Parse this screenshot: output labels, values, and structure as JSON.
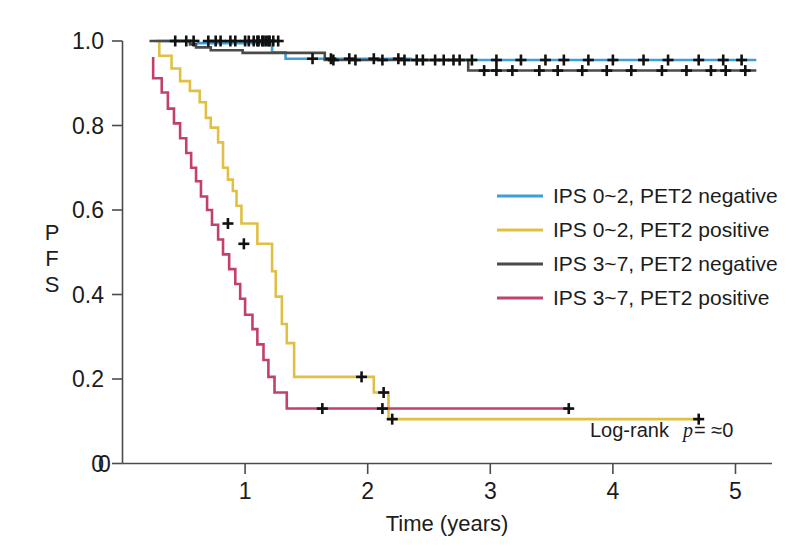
{
  "chart_data": {
    "type": "line",
    "subtype": "kaplan-meier-step",
    "title": "",
    "xlabel": "Time (years)",
    "ylabel": "PFS",
    "xlim": [
      0,
      5.2
    ],
    "ylim": [
      0,
      1.02
    ],
    "xticks": [
      "0",
      "1",
      "2",
      "3",
      "4",
      "5"
    ],
    "xtick_values": [
      0,
      1,
      2,
      3,
      4,
      5
    ],
    "yticks": [
      "0",
      "0.2",
      "0.4",
      "0.6",
      "0.8",
      "1.0"
    ],
    "ytick_values": [
      0,
      0.2,
      0.4,
      0.6,
      0.8,
      1.0
    ],
    "grid": false,
    "legend_position": "center-right",
    "annotation": {
      "prefix": "Log-rank ",
      "italic": "p",
      "suffix": "= ≈0",
      "full": "Log-rank p= ≈0"
    },
    "series": [
      {
        "name": "IPS 0~2, PET2 negative",
        "color": "#3a9fdc",
        "points": [
          [
            0.27,
            1.0
          ],
          [
            0.62,
            1.0
          ],
          [
            0.62,
            0.995
          ],
          [
            1.22,
            0.995
          ],
          [
            1.22,
            0.973
          ],
          [
            1.33,
            0.973
          ],
          [
            1.33,
            0.958
          ],
          [
            2.35,
            0.958
          ],
          [
            2.35,
            0.955
          ],
          [
            5.17,
            0.955
          ]
        ],
        "censors": [
          [
            0.52,
            1.0
          ],
          [
            0.7,
            1.0
          ],
          [
            0.8,
            1.0
          ],
          [
            0.92,
            1.0
          ],
          [
            1.03,
            1.0
          ],
          [
            1.1,
            1.0
          ],
          [
            1.14,
            1.0
          ],
          [
            1.17,
            1.0
          ],
          [
            1.2,
            1.0
          ],
          [
            1.55,
            0.958
          ],
          [
            1.7,
            0.958
          ],
          [
            1.85,
            0.958
          ],
          [
            2.05,
            0.958
          ],
          [
            2.25,
            0.958
          ],
          [
            2.4,
            0.955
          ],
          [
            2.55,
            0.955
          ],
          [
            2.7,
            0.955
          ],
          [
            2.85,
            0.955
          ],
          [
            3.05,
            0.955
          ],
          [
            3.25,
            0.955
          ],
          [
            3.45,
            0.955
          ],
          [
            3.6,
            0.955
          ],
          [
            3.8,
            0.955
          ],
          [
            4.0,
            0.955
          ],
          [
            4.25,
            0.955
          ],
          [
            4.45,
            0.955
          ],
          [
            4.7,
            0.955
          ],
          [
            4.9,
            0.955
          ],
          [
            5.05,
            0.955
          ]
        ]
      },
      {
        "name": "IPS 0~2, PET2 positive",
        "color": "#e0c044",
        "points": [
          [
            0.3,
            1.0
          ],
          [
            0.3,
            0.965
          ],
          [
            0.4,
            0.965
          ],
          [
            0.4,
            0.935
          ],
          [
            0.47,
            0.935
          ],
          [
            0.47,
            0.905
          ],
          [
            0.55,
            0.905
          ],
          [
            0.55,
            0.882
          ],
          [
            0.63,
            0.882
          ],
          [
            0.63,
            0.855
          ],
          [
            0.68,
            0.855
          ],
          [
            0.68,
            0.818
          ],
          [
            0.72,
            0.818
          ],
          [
            0.72,
            0.795
          ],
          [
            0.78,
            0.795
          ],
          [
            0.78,
            0.76
          ],
          [
            0.82,
            0.76
          ],
          [
            0.82,
            0.7
          ],
          [
            0.86,
            0.7
          ],
          [
            0.86,
            0.672
          ],
          [
            0.9,
            0.672
          ],
          [
            0.9,
            0.645
          ],
          [
            0.93,
            0.645
          ],
          [
            0.93,
            0.61
          ],
          [
            0.97,
            0.61
          ],
          [
            0.97,
            0.568
          ],
          [
            1.1,
            0.568
          ],
          [
            1.1,
            0.52
          ],
          [
            1.22,
            0.52
          ],
          [
            1.22,
            0.455
          ],
          [
            1.25,
            0.455
          ],
          [
            1.25,
            0.395
          ],
          [
            1.3,
            0.395
          ],
          [
            1.3,
            0.33
          ],
          [
            1.34,
            0.33
          ],
          [
            1.34,
            0.285
          ],
          [
            1.4,
            0.285
          ],
          [
            1.4,
            0.205
          ],
          [
            2.05,
            0.205
          ],
          [
            2.05,
            0.168
          ],
          [
            2.17,
            0.168
          ],
          [
            2.17,
            0.105
          ],
          [
            4.72,
            0.105
          ]
        ],
        "censors": [
          [
            0.86,
            0.568
          ],
          [
            0.99,
            0.52
          ],
          [
            1.95,
            0.205
          ],
          [
            2.13,
            0.168
          ],
          [
            2.2,
            0.105
          ],
          [
            4.7,
            0.105
          ]
        ]
      },
      {
        "name": "IPS 3~7, PET2 negative",
        "color": "#4a4a4a",
        "points": [
          [
            0.22,
            1.0
          ],
          [
            0.55,
            1.0
          ],
          [
            0.55,
            0.992
          ],
          [
            0.6,
            0.992
          ],
          [
            0.6,
            0.985
          ],
          [
            0.72,
            0.985
          ],
          [
            0.72,
            0.978
          ],
          [
            0.98,
            0.978
          ],
          [
            0.98,
            0.972
          ],
          [
            1.65,
            0.972
          ],
          [
            1.65,
            0.955
          ],
          [
            2.82,
            0.955
          ],
          [
            2.82,
            0.93
          ],
          [
            5.17,
            0.93
          ]
        ],
        "censors": [
          [
            0.43,
            1.0
          ],
          [
            0.58,
            1.0
          ],
          [
            0.76,
            1.0
          ],
          [
            0.88,
            1.0
          ],
          [
            1.0,
            1.0
          ],
          [
            1.07,
            1.0
          ],
          [
            1.11,
            1.0
          ],
          [
            1.15,
            1.0
          ],
          [
            1.19,
            1.0
          ],
          [
            1.23,
            1.0
          ],
          [
            1.27,
            1.0
          ],
          [
            1.72,
            0.955
          ],
          [
            1.9,
            0.955
          ],
          [
            2.12,
            0.955
          ],
          [
            2.3,
            0.955
          ],
          [
            2.45,
            0.955
          ],
          [
            2.62,
            0.955
          ],
          [
            2.75,
            0.955
          ],
          [
            2.95,
            0.93
          ],
          [
            3.05,
            0.93
          ],
          [
            3.18,
            0.93
          ],
          [
            3.4,
            0.93
          ],
          [
            3.55,
            0.93
          ],
          [
            3.75,
            0.93
          ],
          [
            3.95,
            0.93
          ],
          [
            4.15,
            0.93
          ],
          [
            4.4,
            0.93
          ],
          [
            4.6,
            0.93
          ],
          [
            4.8,
            0.93
          ],
          [
            4.92,
            0.93
          ],
          [
            5.08,
            0.93
          ]
        ]
      },
      {
        "name": "IPS 3~7, PET2 positive",
        "color": "#c2416a",
        "points": [
          [
            0.25,
            0.962
          ],
          [
            0.25,
            0.912
          ],
          [
            0.32,
            0.912
          ],
          [
            0.32,
            0.878
          ],
          [
            0.37,
            0.878
          ],
          [
            0.37,
            0.84
          ],
          [
            0.42,
            0.84
          ],
          [
            0.42,
            0.805
          ],
          [
            0.47,
            0.805
          ],
          [
            0.47,
            0.77
          ],
          [
            0.52,
            0.77
          ],
          [
            0.52,
            0.735
          ],
          [
            0.56,
            0.735
          ],
          [
            0.56,
            0.7
          ],
          [
            0.6,
            0.7
          ],
          [
            0.6,
            0.668
          ],
          [
            0.64,
            0.668
          ],
          [
            0.64,
            0.632
          ],
          [
            0.69,
            0.632
          ],
          [
            0.69,
            0.6
          ],
          [
            0.73,
            0.6
          ],
          [
            0.73,
            0.565
          ],
          [
            0.78,
            0.565
          ],
          [
            0.78,
            0.53
          ],
          [
            0.82,
            0.53
          ],
          [
            0.82,
            0.495
          ],
          [
            0.87,
            0.495
          ],
          [
            0.87,
            0.46
          ],
          [
            0.92,
            0.46
          ],
          [
            0.92,
            0.425
          ],
          [
            0.96,
            0.425
          ],
          [
            0.96,
            0.39
          ],
          [
            1.0,
            0.39
          ],
          [
            1.0,
            0.352
          ],
          [
            1.06,
            0.352
          ],
          [
            1.06,
            0.318
          ],
          [
            1.1,
            0.318
          ],
          [
            1.1,
            0.282
          ],
          [
            1.15,
            0.282
          ],
          [
            1.15,
            0.245
          ],
          [
            1.19,
            0.245
          ],
          [
            1.19,
            0.205
          ],
          [
            1.24,
            0.205
          ],
          [
            1.24,
            0.168
          ],
          [
            1.34,
            0.168
          ],
          [
            1.34,
            0.13
          ],
          [
            3.66,
            0.13
          ]
        ],
        "censors": [
          [
            1.63,
            0.13
          ],
          [
            2.12,
            0.13
          ],
          [
            3.64,
            0.13
          ]
        ]
      }
    ]
  },
  "legend": {
    "items": [
      {
        "label": "IPS 0~2, PET2 negative",
        "color": "#3a9fdc"
      },
      {
        "label": "IPS 0~2, PET2 positive",
        "color": "#e0c044"
      },
      {
        "label": "IPS 3~7, PET2 negative",
        "color": "#4a4a4a"
      },
      {
        "label": "IPS 3~7, PET2 positive",
        "color": "#c2416a"
      }
    ]
  },
  "axes": {
    "x_title": "Time (years)",
    "y_title_chars": [
      "P",
      "F",
      "S"
    ],
    "x_tick_labels": [
      "0",
      "1",
      "2",
      "3",
      "4",
      "5"
    ],
    "y_tick_labels": [
      "1.0",
      "0.8",
      "0.6",
      "0.4",
      "0.2",
      "0"
    ]
  }
}
